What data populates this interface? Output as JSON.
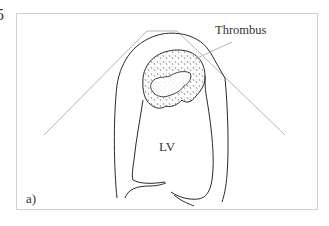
{
  "figure": {
    "number_fragment": "5",
    "panel_label": "a)",
    "labels": {
      "thrombus": "Thrombus",
      "lv": "LV"
    },
    "colors": {
      "outline": "#2a2a2a",
      "sector": "#b5b5b5",
      "frame": "#cfcfcf",
      "stipple": "#555555"
    }
  }
}
